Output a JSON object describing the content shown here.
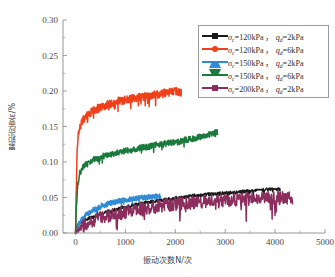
{
  "chart_data": {
    "type": "line",
    "title": "",
    "xlabel": "振动次数N/次",
    "ylabel": "累积应变ε/%",
    "xlim": [
      -250,
      5000
    ],
    "ylim": [
      0.0,
      0.3
    ],
    "xticks": [
      0,
      1000,
      2000,
      3000,
      4000,
      5000
    ],
    "xticklabels": [
      "0",
      "1000",
      "2000",
      "3000",
      "4000",
      "5000"
    ],
    "yticks": [
      0.0,
      0.05,
      0.1,
      0.15,
      0.2,
      0.25,
      0.3
    ],
    "yticklabels": [
      "0.00",
      "0.05",
      "0.10",
      "0.15",
      "0.20",
      "0.25",
      "0.30"
    ],
    "grid": false,
    "minor_ticks": true,
    "legend_position": "upper right",
    "series": [
      {
        "name": "sigma_c=120kPa, q_d=2kPa",
        "color": "#1a1a1a",
        "marker": "square",
        "noise": 0.0022,
        "x": [
          0,
          20,
          60,
          120,
          200,
          320,
          480,
          700,
          950,
          1200,
          1500,
          1800,
          2100,
          2450,
          2800,
          3150,
          3500,
          3800,
          4100
        ],
        "y": [
          0.0,
          0.009,
          0.013,
          0.016,
          0.019,
          0.022,
          0.026,
          0.031,
          0.036,
          0.04,
          0.044,
          0.047,
          0.05,
          0.053,
          0.055,
          0.057,
          0.059,
          0.061,
          0.062
        ]
      },
      {
        "name": "sigma_c=120kPa, q_d=6kPa",
        "color": "#F0401A",
        "marker": "circle",
        "noise": 0.0055,
        "x": [
          0,
          15,
          35,
          60,
          100,
          160,
          240,
          350,
          500,
          700,
          900,
          1100,
          1350,
          1600,
          1850,
          2000,
          2120
        ],
        "y": [
          0.0,
          0.06,
          0.118,
          0.141,
          0.152,
          0.16,
          0.166,
          0.172,
          0.177,
          0.182,
          0.186,
          0.189,
          0.192,
          0.195,
          0.198,
          0.2,
          0.197
        ]
      },
      {
        "name": "sigma_c=150kPa, q_d=2kPa",
        "color": "#2E8BD4",
        "marker": "triangle-up",
        "noise": 0.0035,
        "x": [
          0,
          25,
          70,
          140,
          240,
          380,
          550,
          750,
          950,
          1150,
          1350,
          1550,
          1700
        ],
        "y": [
          0.0,
          0.006,
          0.013,
          0.02,
          0.027,
          0.033,
          0.039,
          0.043,
          0.046,
          0.048,
          0.05,
          0.051,
          0.052
        ]
      },
      {
        "name": "sigma_c=150kPa, q_d=6kPa",
        "color": "#1A7A3C",
        "marker": "triangle-down",
        "noise": 0.0042,
        "x": [
          0,
          20,
          50,
          90,
          150,
          250,
          400,
          600,
          850,
          1100,
          1400,
          1700,
          2000,
          2300,
          2550,
          2750,
          2850
        ],
        "y": [
          0.0,
          0.04,
          0.071,
          0.085,
          0.093,
          0.099,
          0.104,
          0.109,
          0.113,
          0.117,
          0.121,
          0.125,
          0.128,
          0.132,
          0.136,
          0.14,
          0.143
        ]
      },
      {
        "name": "sigma_c=200kPa, q_d=2kPa",
        "color": "#8B2E5E",
        "marker": "diamond",
        "noise": 0.0095,
        "x": [
          0,
          50,
          150,
          300,
          500,
          750,
          1000,
          1300,
          1600,
          1900,
          2200,
          2550,
          2900,
          3250,
          3600,
          3950,
          4350
        ],
        "y": [
          -0.001,
          0.004,
          0.01,
          0.016,
          0.021,
          0.026,
          0.03,
          0.034,
          0.037,
          0.04,
          0.042,
          0.044,
          0.046,
          0.047,
          0.048,
          0.049,
          0.05
        ]
      }
    ]
  },
  "legend": {
    "items": [
      {
        "sigma_label": "σ",
        "sigma_sub": "c",
        "sigma_value": "=120kPa",
        "sep": "，",
        "q_label": "q",
        "q_sub": "d",
        "q_value": "=2kPa",
        "color": "#1a1a1a",
        "marker": "square"
      },
      {
        "sigma_label": "σ",
        "sigma_sub": "c",
        "sigma_value": "=120kPa",
        "sep": "，",
        "q_label": "q",
        "q_sub": "d",
        "q_value": "=6kPa",
        "color": "#F0401A",
        "marker": "circle"
      },
      {
        "sigma_label": "σ",
        "sigma_sub": "c",
        "sigma_value": "=150kPa",
        "sep": "，",
        "q_label": "q",
        "q_sub": "d",
        "q_value": "=2kPa",
        "color": "#2E8BD4",
        "marker": "triangle-up"
      },
      {
        "sigma_label": "σ",
        "sigma_sub": "c",
        "sigma_value": "=150kPa",
        "sep": "，",
        "q_label": "q",
        "q_sub": "d",
        "q_value": "=6kPa",
        "color": "#1A7A3C",
        "marker": "triangle-down"
      },
      {
        "sigma_label": "σ",
        "sigma_sub": "c",
        "sigma_value": "=200kPa",
        "sep": "，",
        "q_label": "q",
        "q_sub": "d",
        "q_value": "=2kPa",
        "color": "#8B2E5E",
        "marker": "diamond"
      }
    ]
  },
  "axes": {
    "x_title": "振动次数N/次",
    "y_title": "累积应变ε/%"
  },
  "colors": {
    "axis": "#8a8a8a",
    "text": "#3f3f3f",
    "background": "#ffffff"
  }
}
